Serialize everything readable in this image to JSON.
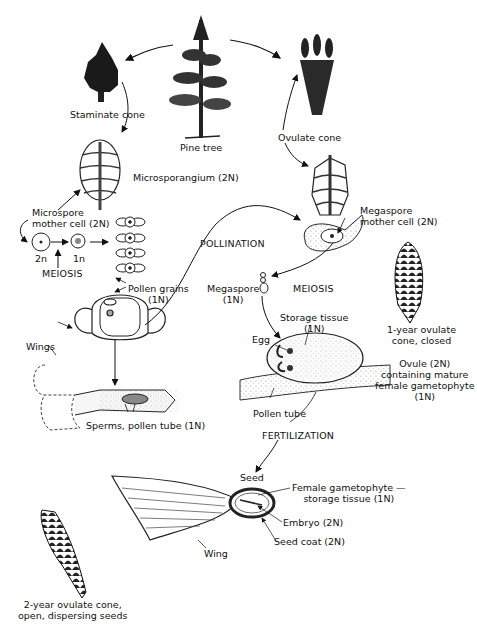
{
  "diagram": {
    "labels": {
      "pine_tree": "Pine tree",
      "staminate_cone": "Staminate cone",
      "ovulate_cone": "Ovulate cone",
      "microsporangium": "Microsporangium (2N)",
      "microspore_mother_cell": "Microspore\nmother cell (2N)",
      "two_n": "2n",
      "one_n": "1n",
      "meiosis_left": "MEIOSIS",
      "pollen_grains": "Pollen grains\n(1N)",
      "wings": "Wings",
      "sperms_pollen_tube": "Sperms, pollen tube (1N)",
      "pollination": "POLLINATION",
      "megaspore_mother_cell": "Megaspore\nmother cell (2N)",
      "megaspore": "Megaspore\n(1N)",
      "meiosis_right": "MEIOSIS",
      "one_year_cone": "1-year ovulate\ncone, closed",
      "storage_tissue": "Storage tissue\n(1N)",
      "egg": "Egg",
      "ovule": "Ovule (2N)\ncontaining mature\nfemale gametophyte\n(1N)",
      "pollen_tube": "Pollen tube",
      "fertilization": "FERTILIZATION",
      "seed": "Seed",
      "female_gametophyte": "Female gametophyte —\nstorage tissue (1N)",
      "embryo": "Embryo (2N)",
      "seed_coat": "Seed coat (2N)",
      "wing": "Wing",
      "two_year_cone": "2-year ovulate cone,\nopen, dispersing seeds"
    }
  }
}
